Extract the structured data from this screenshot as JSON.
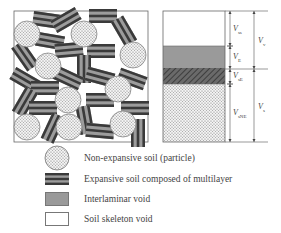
{
  "diagram": {
    "left_panel": {
      "description": "Soil microstructure with non-expansive particles and expansive multilayer stacks"
    },
    "right_panel": {
      "layers": [
        {
          "name": "soil-skeleton-void",
          "color": "#ffffff"
        },
        {
          "name": "interlaminar-void",
          "color": "#9a9a9a"
        },
        {
          "name": "expansive-soil",
          "color": "#555555"
        },
        {
          "name": "non-expansive-soil",
          "color": "#dcdcdc"
        }
      ],
      "dimensions": {
        "inner": [
          {
            "label": "V",
            "sub": "ss"
          },
          {
            "label": "V",
            "sub": "E"
          },
          {
            "label": "V",
            "sub": "sE"
          },
          {
            "label": "V",
            "sub": "sNE"
          }
        ],
        "outer": [
          {
            "label": "V",
            "sub": "v"
          },
          {
            "label": "V",
            "sub": "s"
          }
        ]
      }
    },
    "legend": [
      {
        "symbol": "dotted-circle",
        "label": "Non-expansive soil (particle)"
      },
      {
        "symbol": "multilayer-stack",
        "label": "Expansive soil composed of multilayer"
      },
      {
        "symbol": "grey-box",
        "label": "Interlaminar void"
      },
      {
        "symbol": "white-box",
        "label": "Soil skeleton void"
      }
    ]
  }
}
